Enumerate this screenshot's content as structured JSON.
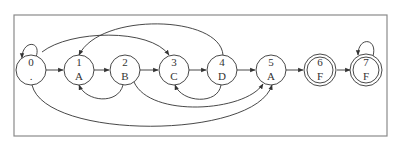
{
  "diagram": {
    "type": "state-machine",
    "nodes": [
      {
        "id": "0",
        "top": "0",
        "bottom": ".",
        "accepting": false,
        "cx": 31,
        "cy": 70
      },
      {
        "id": "1",
        "top": "1",
        "bottom": "A",
        "accepting": false,
        "cx": 79,
        "cy": 70
      },
      {
        "id": "2",
        "top": "2",
        "bottom": "B",
        "accepting": false,
        "cx": 125,
        "cy": 70
      },
      {
        "id": "3",
        "top": "3",
        "bottom": "C",
        "accepting": false,
        "cx": 174,
        "cy": 70
      },
      {
        "id": "4",
        "top": "4",
        "bottom": "D",
        "accepting": false,
        "cx": 222,
        "cy": 70
      },
      {
        "id": "5",
        "top": "5",
        "bottom": "A",
        "accepting": false,
        "cx": 271,
        "cy": 70
      },
      {
        "id": "6",
        "top": "6",
        "bottom": "F",
        "accepting": true,
        "cx": 320,
        "cy": 70
      },
      {
        "id": "7",
        "top": "7",
        "bottom": "F",
        "accepting": true,
        "cx": 366,
        "cy": 70
      }
    ],
    "edges": [
      {
        "from": "0",
        "to": "0",
        "kind": "self-loop"
      },
      {
        "from": "0",
        "to": "1",
        "kind": "straight"
      },
      {
        "from": "1",
        "to": "2",
        "kind": "straight"
      },
      {
        "from": "2",
        "to": "3",
        "kind": "straight"
      },
      {
        "from": "3",
        "to": "4",
        "kind": "straight"
      },
      {
        "from": "4",
        "to": "5",
        "kind": "straight"
      },
      {
        "from": "5",
        "to": "6",
        "kind": "straight"
      },
      {
        "from": "6",
        "to": "7",
        "kind": "straight"
      },
      {
        "from": "7",
        "to": "7",
        "kind": "self-loop"
      },
      {
        "from": "0",
        "to": "3",
        "kind": "arc-top"
      },
      {
        "from": "4",
        "to": "1",
        "kind": "arc-top"
      },
      {
        "from": "2",
        "to": "1",
        "kind": "arc-bottom"
      },
      {
        "from": "4",
        "to": "3",
        "kind": "arc-bottom"
      },
      {
        "from": "2",
        "to": "5",
        "kind": "arc-bottom"
      },
      {
        "from": "0",
        "to": "5",
        "kind": "arc-bottom-large"
      }
    ]
  }
}
